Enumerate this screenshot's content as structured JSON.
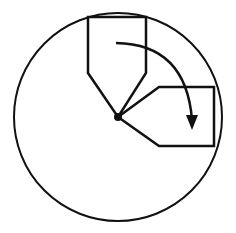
{
  "diagram": {
    "colors": {
      "stroke": "#111111",
      "background": "#ffffff"
    },
    "circle": {
      "cx": 118,
      "cy": 117,
      "r": 104
    },
    "pivot": {
      "cx": 118,
      "cy": 117,
      "r": 4
    },
    "shape_initial": {
      "points": "88,17 146,17 146,73 118,117 88,73"
    },
    "shape_rotated": {
      "points": "214,87 214,146 159,146 118,117 159,87"
    },
    "arrow": {
      "path": "M 116 43 Q 186 44 192 120",
      "direction": "clockwise"
    }
  }
}
